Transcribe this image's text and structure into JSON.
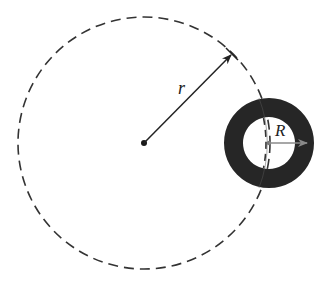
{
  "diagram": {
    "type": "orbit-geometry",
    "labels": {
      "orbit_radius": "r",
      "body_radius": "R"
    },
    "orbit": {
      "center": [
        144,
        143
      ],
      "radius": 126,
      "style": "dashed",
      "color": "#333333"
    },
    "body": {
      "center": [
        269,
        143
      ],
      "outer_radius": 45,
      "inner_radius": 26,
      "fill": "#262626"
    },
    "arrows": [
      {
        "name": "orbit-radius-arrow",
        "from": [
          144,
          143
        ],
        "to": [
          232,
          54
        ],
        "color": "#222222",
        "label": "r"
      },
      {
        "name": "body-radius-arrow",
        "from": [
          269,
          143
        ],
        "to": [
          308,
          143
        ],
        "color": "#8a8a8a",
        "label": "R"
      }
    ],
    "colors": {
      "background": "#ffffff",
      "ring": "#262626",
      "dash": "#333333",
      "inner_arrow": "#8a8a8a"
    }
  }
}
